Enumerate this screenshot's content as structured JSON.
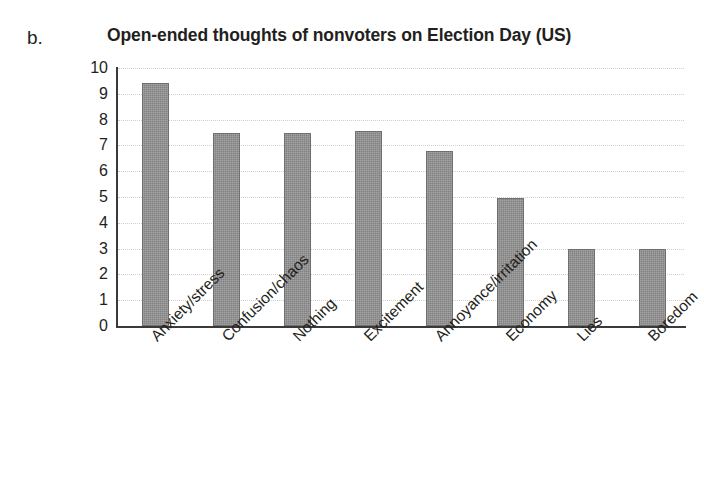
{
  "panel": {
    "label": "b."
  },
  "chart_data": {
    "type": "bar",
    "title": "Open-ended thoughts of nonvoters on Election Day (US)",
    "xlabel": "",
    "ylabel": "",
    "ylim": [
      0,
      10
    ],
    "grid": true,
    "legend": "none",
    "bar_color": "#8d8d8d",
    "bar_edge_color": "#6f6f6f",
    "y_ticks": [
      "10",
      "9",
      "8",
      "7",
      "6",
      "5",
      "4",
      "3",
      "2",
      "1",
      "0"
    ],
    "categories": [
      "Anxiety/stress",
      "Confusion/chaos",
      "Nothing",
      "Excitement",
      "Annoyance/irritation",
      "Economy",
      "Lies",
      "Boredom"
    ],
    "values": [
      9.4,
      7.5,
      7.5,
      7.55,
      6.8,
      4.95,
      3.0,
      3.0
    ]
  }
}
